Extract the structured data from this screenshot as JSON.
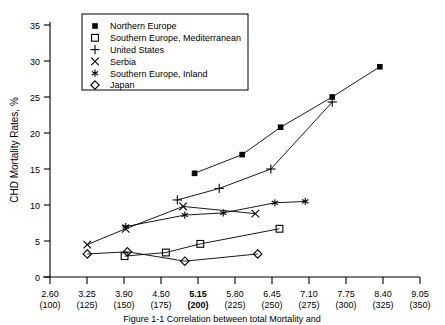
{
  "chart_data": {
    "type": "line",
    "title": "",
    "xlabel": "",
    "ylabel": "CHD Mortality Rates, %",
    "xlim": [
      2.6,
      9.05
    ],
    "ylim": [
      0,
      35
    ],
    "grid": false,
    "legend_position": "top-center",
    "x_ticks_primary": [
      "2.60",
      "3.25",
      "3.90",
      "4.50",
      "5.15",
      "5.80",
      "6.45",
      "7.10",
      "7.75",
      "8.40",
      "9.05"
    ],
    "x_ticks_secondary": [
      "(100)",
      "(125)",
      "(150)",
      "(175)",
      "(200)",
      "(225)",
      "(250)",
      "(275)",
      "(300)",
      "(325)",
      "(350)"
    ],
    "x_tick_bold_index": 4,
    "y_ticks": [
      "0",
      "5",
      "10",
      "15",
      "20",
      "25",
      "30",
      "35"
    ],
    "series": [
      {
        "name": "Northern Europe",
        "marker": "filled-square",
        "points": [
          [
            5.12,
            14.4
          ],
          [
            5.95,
            17.0
          ],
          [
            6.62,
            20.8
          ],
          [
            7.52,
            25.0
          ],
          [
            8.35,
            29.2
          ]
        ]
      },
      {
        "name": "Southern Europe, Mediterranean",
        "marker": "open-square",
        "points": [
          [
            3.9,
            2.9
          ],
          [
            4.62,
            3.4
          ],
          [
            5.22,
            4.6
          ],
          [
            6.6,
            6.7
          ]
        ]
      },
      {
        "name": "United States",
        "marker": "plus",
        "points": [
          [
            4.82,
            10.7
          ],
          [
            5.55,
            12.3
          ],
          [
            6.45,
            15.0
          ],
          [
            7.52,
            24.3
          ]
        ]
      },
      {
        "name": "Serbia",
        "marker": "cross",
        "points": [
          [
            3.25,
            4.5
          ],
          [
            3.92,
            6.7
          ],
          [
            4.92,
            9.8
          ],
          [
            6.18,
            8.8
          ]
        ]
      },
      {
        "name": "Southern Europe, Inland",
        "marker": "asterisk",
        "points": [
          [
            3.92,
            7.0
          ],
          [
            4.95,
            8.6
          ],
          [
            5.62,
            8.9
          ],
          [
            6.52,
            10.3
          ],
          [
            7.05,
            10.5
          ]
        ]
      },
      {
        "name": "Japan",
        "marker": "diamond",
        "points": [
          [
            3.25,
            3.2
          ],
          [
            3.95,
            3.5
          ],
          [
            4.95,
            2.2
          ],
          [
            6.22,
            3.2
          ]
        ]
      }
    ]
  },
  "legend": {
    "entries": [
      {
        "marker": "filled-square",
        "label": "Northern Europe"
      },
      {
        "marker": "open-square",
        "label": "Southern Europe, Mediterranean"
      },
      {
        "marker": "plus",
        "label": "United States"
      },
      {
        "marker": "cross",
        "label": "Serbia"
      },
      {
        "marker": "asterisk",
        "label": "Southern Europe, Inland"
      },
      {
        "marker": "diamond",
        "label": "Japan"
      }
    ]
  },
  "caption": {
    "text": "Figure 1-1  Correlation between total Mortality and"
  }
}
